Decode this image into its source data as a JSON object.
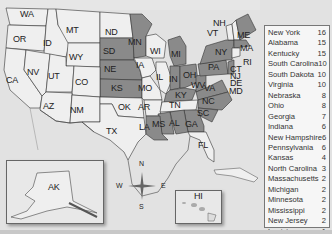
{
  "map": {
    "shaded_color": "#8a8a8a",
    "unshaded_color": "#ededed",
    "water_color": "#e2e2e2",
    "state_labels": [
      {
        "code": "WA",
        "x": 27,
        "y": 14,
        "shaded": false
      },
      {
        "code": "OR",
        "x": 20,
        "y": 39,
        "shaded": false
      },
      {
        "code": "ID",
        "x": 50,
        "y": 43,
        "shaded": false
      },
      {
        "code": "MT",
        "x": 73,
        "y": 30,
        "shaded": false
      },
      {
        "code": "WY",
        "x": 76,
        "y": 57,
        "shaded": false
      },
      {
        "code": "ND",
        "x": 112,
        "y": 32,
        "shaded": false
      },
      {
        "code": "SD",
        "x": 110,
        "y": 51,
        "shaded": true
      },
      {
        "code": "NE",
        "x": 111,
        "y": 69,
        "shaded": true
      },
      {
        "code": "KS",
        "x": 118,
        "y": 88,
        "shaded": true
      },
      {
        "code": "NV",
        "x": 34,
        "y": 72,
        "shaded": false
      },
      {
        "code": "UT",
        "x": 55,
        "y": 76,
        "shaded": false
      },
      {
        "code": "CO",
        "x": 82,
        "y": 82,
        "shaded": false
      },
      {
        "code": "CA",
        "x": 13,
        "y": 80,
        "shaded": false
      },
      {
        "code": "AZ",
        "x": 50,
        "y": 106,
        "shaded": false
      },
      {
        "code": "NM",
        "x": 77,
        "y": 110,
        "shaded": false
      },
      {
        "code": "OK",
        "x": 125,
        "y": 107,
        "shaded": false
      },
      {
        "code": "TX",
        "x": 113,
        "y": 131,
        "shaded": false
      },
      {
        "code": "MN",
        "x": 135,
        "y": 42,
        "shaded": true
      },
      {
        "code": "IA",
        "x": 143,
        "y": 65,
        "shaded": false
      },
      {
        "code": "MO",
        "x": 145,
        "y": 88,
        "shaded": false
      },
      {
        "code": "AR",
        "x": 145,
        "y": 107,
        "shaded": false
      },
      {
        "code": "LA",
        "x": 146,
        "y": 127,
        "shaded": true
      },
      {
        "code": "MS",
        "x": 159,
        "y": 124,
        "shaded": true
      },
      {
        "code": "AL",
        "x": 176,
        "y": 123,
        "shaded": true
      },
      {
        "code": "GA",
        "x": 192,
        "y": 124,
        "shaded": true
      },
      {
        "code": "WI",
        "x": 157,
        "y": 51,
        "shaded": false
      },
      {
        "code": "IL",
        "x": 163,
        "y": 77,
        "shaded": false
      },
      {
        "code": "MI",
        "x": 178,
        "y": 54,
        "shaded": true
      },
      {
        "code": "IN",
        "x": 176,
        "y": 79,
        "shaded": true
      },
      {
        "code": "OH",
        "x": 190,
        "y": 75,
        "shaded": true
      },
      {
        "code": "KY",
        "x": 182,
        "y": 95,
        "shaded": true
      },
      {
        "code": "TN",
        "x": 176,
        "y": 105,
        "shaded": false
      },
      {
        "code": "WV",
        "x": 198,
        "y": 85,
        "shaded": true
      },
      {
        "code": "VA",
        "x": 211,
        "y": 88,
        "shaded": true
      },
      {
        "code": "NC",
        "x": 209,
        "y": 101,
        "shaded": true
      },
      {
        "code": "SC",
        "x": 204,
        "y": 113,
        "shaded": true
      },
      {
        "code": "FL",
        "x": 205,
        "y": 145,
        "shaded": false
      },
      {
        "code": "PA",
        "x": 215,
        "y": 67,
        "shaded": true
      },
      {
        "code": "NY",
        "x": 222,
        "y": 52,
        "shaded": true
      },
      {
        "code": "NH",
        "x": 220,
        "y": 23,
        "shaded": false
      },
      {
        "code": "VT",
        "x": 214,
        "y": 33,
        "shaded": false
      },
      {
        "code": "ME",
        "x": 244,
        "y": 35,
        "shaded": true
      },
      {
        "code": "MA",
        "x": 247,
        "y": 48,
        "shaded": true
      },
      {
        "code": "RI",
        "x": 250,
        "y": 62,
        "shaded": false
      },
      {
        "code": "CT",
        "x": 237,
        "y": 69,
        "shaded": false
      },
      {
        "code": "NJ",
        "x": 237,
        "y": 76,
        "shaded": true
      },
      {
        "code": "DE",
        "x": 237,
        "y": 83,
        "shaded": false
      },
      {
        "code": "MD",
        "x": 236,
        "y": 91,
        "shaded": false
      },
      {
        "code": "AK",
        "x": 55,
        "y": 187,
        "shaded": false
      },
      {
        "code": "HI",
        "x": 201,
        "y": 196,
        "shaded": false
      }
    ],
    "compass": {
      "n": "N",
      "s": "S",
      "e": "E",
      "w": "W"
    }
  },
  "legend": {
    "items": [
      {
        "state": "New York",
        "count": "16"
      },
      {
        "state": "Alabama",
        "count": "15"
      },
      {
        "state": "Kentucky",
        "count": "15"
      },
      {
        "state": "South Carolina",
        "count": "10"
      },
      {
        "state": "South Dakota",
        "count": "10"
      },
      {
        "state": "Virginia",
        "count": "10"
      },
      {
        "state": "Nebraska",
        "count": "8"
      },
      {
        "state": "Ohio",
        "count": "8"
      },
      {
        "state": "Georgia",
        "count": "7"
      },
      {
        "state": "Indiana",
        "count": "6"
      },
      {
        "state": "New Hampshire",
        "count": "6"
      },
      {
        "state": "Pennsylvania",
        "count": "6"
      },
      {
        "state": "Kansas",
        "count": "4"
      },
      {
        "state": "North Carolina",
        "count": "3"
      },
      {
        "state": "Massachusetts",
        "count": "2"
      },
      {
        "state": "Michigan",
        "count": "2"
      },
      {
        "state": "Minnesota",
        "count": "2"
      },
      {
        "state": "Mississippi",
        "count": "2"
      },
      {
        "state": "New Jersey",
        "count": "2"
      },
      {
        "state": "Louisiana",
        "count": "1"
      },
      {
        "state": "Rhode Island",
        "count": "1"
      },
      {
        "state": "West Virginia",
        "count": "1"
      }
    ]
  }
}
